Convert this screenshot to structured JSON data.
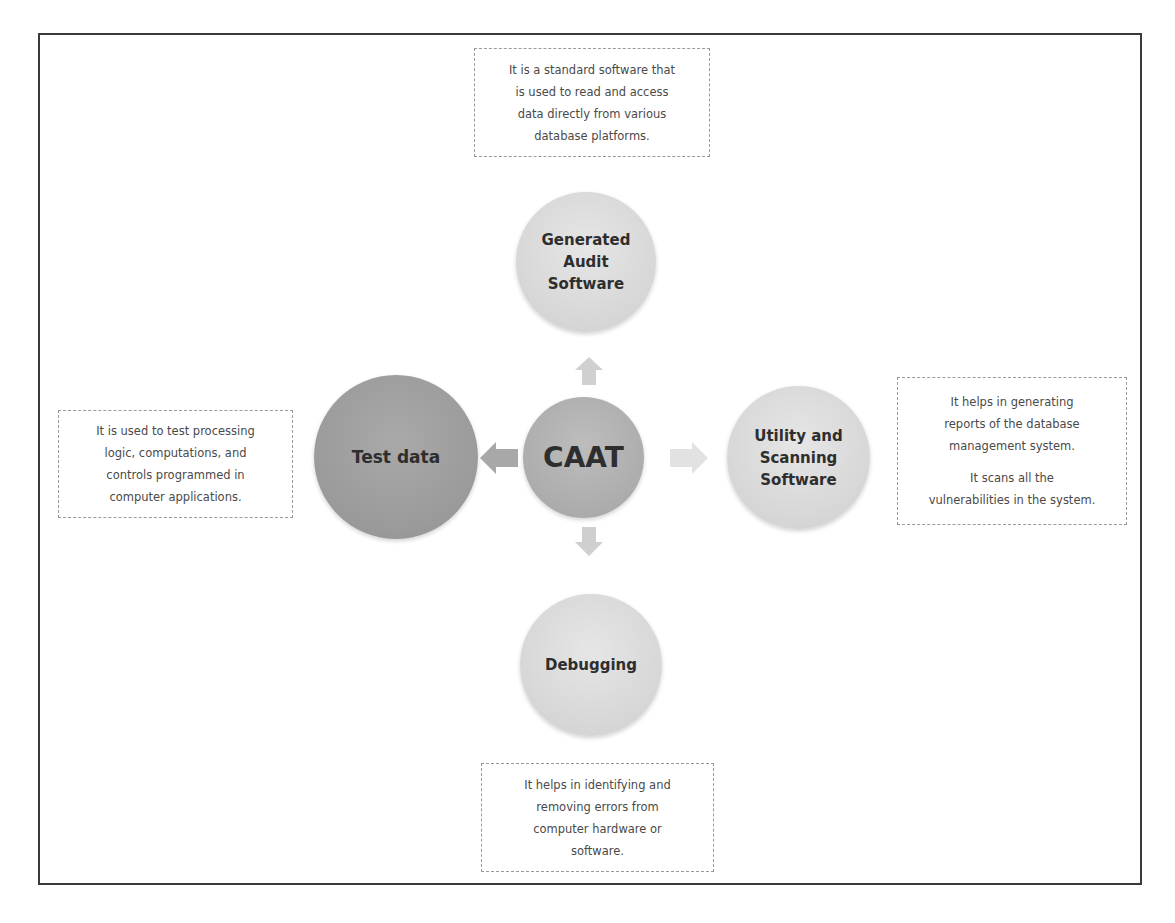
{
  "diagram": {
    "center": {
      "label": "CAAT",
      "color": "#acacac"
    },
    "nodes": [
      {
        "id": "generated-audit-software",
        "position": "top",
        "label_lines": [
          "Generated",
          "Audit",
          "Software"
        ],
        "color": "#d9d9d9",
        "description": [
          "It is a standard software that is used to read and access data directly from various database platforms."
        ]
      },
      {
        "id": "test-data",
        "position": "left",
        "label_lines": [
          "Test data"
        ],
        "color": "#9d9d9d",
        "description": [
          "It is used to test processing logic, computations, and controls programmed in computer applications."
        ]
      },
      {
        "id": "utility-and-scanning-software",
        "position": "right",
        "label_lines": [
          "Utility and",
          "Scanning",
          "Software"
        ],
        "color": "#d9d9d9",
        "description": [
          "It helps in generating reports of the database management system.",
          "It scans all the vulnerabilities in the system."
        ]
      },
      {
        "id": "debugging",
        "position": "bottom",
        "label_lines": [
          "Debugging"
        ],
        "color": "#d9d9d9",
        "description": [
          "It helps in identifying and removing errors from computer hardware or software."
        ]
      }
    ],
    "arrows": [
      {
        "direction": "up",
        "color": "#d0d0d0"
      },
      {
        "direction": "left",
        "color": "#a8a8a8"
      },
      {
        "direction": "right",
        "color": "#e2e2e2"
      },
      {
        "direction": "down",
        "color": "#cfcfcf"
      }
    ],
    "frame_color": "#3a3a3a",
    "dashed_border_color": "#9a9a9a"
  },
  "text": {
    "top_desc": "It is a standard software that is used to read and access data directly from various database platforms.",
    "top_desc_lines": [
      "It is a standard software that",
      "is used to read and access",
      "data directly from various",
      "database platforms."
    ],
    "left_desc_lines": [
      "It is used to test processing",
      "logic, computations, and",
      "controls programmed in",
      "computer applications."
    ],
    "right_desc_p1_lines": [
      "It helps in generating",
      "reports of the database",
      "management system."
    ],
    "right_desc_p2_lines": [
      "It scans all the",
      "vulnerabilities in the system."
    ],
    "bottom_desc_lines": [
      "It helps in identifying and",
      "removing errors from",
      "computer hardware or",
      "software."
    ],
    "center_label": "CAAT",
    "top_node_lines": [
      "Generated",
      "Audit",
      "Software"
    ],
    "left_node_label": "Test data",
    "right_node_lines": [
      "Utility and",
      "Scanning",
      "Software"
    ],
    "bottom_node_label": "Debugging"
  }
}
